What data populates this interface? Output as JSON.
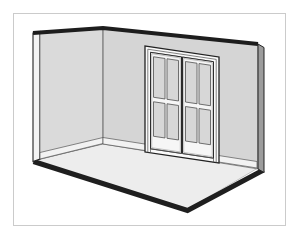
{
  "scene": {
    "name": "empty-room-3d-cutaway-illustration",
    "description": "Grayscale line-art 3D cutaway of an empty room: a narrow left wall seen edge-on, a large back wall, a light floor slab with dark front edges, white baseboards, and a closed double French door set in the back wall.",
    "objects": [
      "left-wall",
      "back-wall",
      "floor",
      "baseboards",
      "french-double-door",
      "glass-panes"
    ],
    "door": {
      "leaves": 2,
      "panes_per_leaf": 4,
      "total_panes": 8
    }
  },
  "colors": {
    "page-bg": "#ffffff",
    "canvas-bg": "#ffffff",
    "frame-border": "#cbcbcb",
    "wall-left": "#dadada",
    "wall-back": "#d5d5d5",
    "wall-top-band": "#1d1d1d",
    "wall-end-cap": "#9c9c9c",
    "wall-cut-edge": "#f3f3f3",
    "floor": "#ededed",
    "floor-edge": "#1f1f1f",
    "baseboard": "#f2f2f2",
    "door-white": "#fafafa",
    "door-leaf": "#f6f6f6",
    "glass": "#d7d7d7",
    "line-dark": "#222222",
    "line-mid": "#555555",
    "line-soft": "#8f8f8f"
  }
}
